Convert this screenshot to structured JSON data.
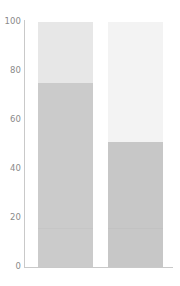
{
  "chart_data": {
    "type": "bar",
    "title": "",
    "subtitle": "",
    "xlabel": "",
    "ylabel": "",
    "categories": [
      "",
      ""
    ],
    "ylim": [
      0,
      100
    ],
    "yticks": [
      0,
      20,
      40,
      60,
      80,
      100
    ],
    "ytick_labels": [
      "0",
      "20",
      "40",
      "60",
      "80",
      "100"
    ],
    "grid": false,
    "legend": "none",
    "stacked": true,
    "series": [
      {
        "name": "lower",
        "values": [
          75,
          51
        ],
        "color": "#cccccc"
      },
      {
        "name": "upper",
        "values": [
          25,
          49
        ],
        "colors": [
          "#e8e8e8",
          "#f3f3f3"
        ]
      }
    ],
    "bars": [
      {
        "index": 0,
        "lower_value": 75,
        "upper_value": 25,
        "lower_color": "#cbcbcb",
        "upper_color": "#e7e7e7",
        "inner_line_value": 16,
        "inner_line_color": "#c2c2c2"
      },
      {
        "index": 1,
        "lower_value": 51,
        "upper_value": 49,
        "lower_color": "#c7c7c7",
        "upper_color": "#f3f3f3",
        "inner_line_value": 16,
        "inner_line_color": "#bdbdbd"
      }
    ]
  },
  "axis": {
    "tick_100": "100",
    "tick_80": "80",
    "tick_60": "60",
    "tick_40": "40",
    "tick_20": "20",
    "tick_0": "0",
    "line_color": "#c9c9c9",
    "label_color": "#8a8a8a"
  },
  "colors": {
    "background": "#ffffff",
    "bar1_lower": "#cbcbcb",
    "bar1_upper": "#e7e7e7",
    "bar2_lower": "#c7c7c7",
    "bar2_upper": "#f3f3f3",
    "axis": "#c9c9c9",
    "tick_text": "#8a8a8a"
  }
}
